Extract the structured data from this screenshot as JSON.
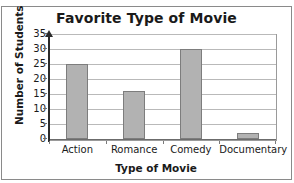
{
  "chart_data": {
    "type": "bar",
    "title": "Favorite Type of Movie",
    "xlabel": "Type of Movie",
    "ylabel": "Number of Students",
    "categories": [
      "Action",
      "Romance",
      "Comedy",
      "Documentary"
    ],
    "values": [
      25,
      16,
      30,
      2
    ],
    "ylim": [
      0,
      35
    ],
    "yticks": [
      0,
      5,
      10,
      15,
      20,
      25,
      30,
      35
    ],
    "grid": true,
    "legend": null,
    "bar_color": "#b2b2b2",
    "bar_border_color": "#7d7d7d",
    "axis_color": "#2b2b2b",
    "grid_color": "#b9b9b9"
  }
}
